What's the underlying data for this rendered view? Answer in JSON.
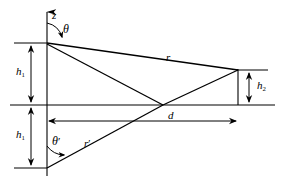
{
  "figure": {
    "stroke_color": "#000000",
    "background_color": "#ffffff",
    "labels": {
      "z_axis": "z",
      "theta": "θ",
      "theta_prime": "θ",
      "theta_prime_mark": "′",
      "r": "r",
      "r_prime": "r",
      "r_prime_mark": "′",
      "d": "d",
      "h1_upper": "h",
      "h1_upper_sub": "1",
      "h1_lower": "h",
      "h1_lower_sub": "1",
      "h2": "h",
      "h2_sub": "2"
    },
    "geometry": {
      "z_axis_x": 47,
      "z_axis_top_y": 8,
      "horizon_y": 105,
      "tx_vertex": [
        47,
        43
      ],
      "image_vertex": [
        47,
        168
      ],
      "rx_top": [
        238,
        70
      ],
      "rx_bottom": [
        238,
        105
      ],
      "crossing_point": [
        163,
        105
      ],
      "dim_line_left_x": 31,
      "dim_line_d_y": 121,
      "dim_line_h2_x": 249,
      "horizon_left_x": 10,
      "horizon_right_x": 275
    }
  }
}
